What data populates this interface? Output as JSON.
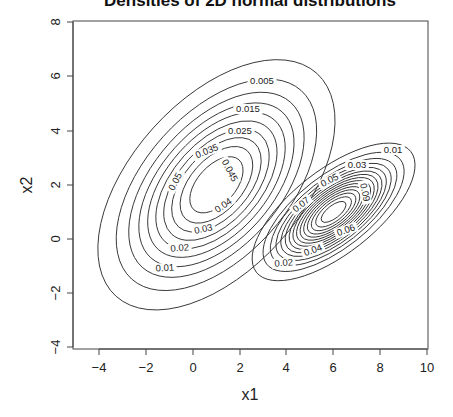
{
  "chart_data": {
    "type": "contour",
    "title": "Densities of 2D normal distributions",
    "xlabel": "x1",
    "ylabel": "x2",
    "xlim": [
      -5,
      10
    ],
    "ylim": [
      -4,
      8
    ],
    "x_ticks": [
      -4,
      -2,
      0,
      2,
      4,
      6,
      8,
      10
    ],
    "y_ticks": [
      -4,
      -2,
      0,
      2,
      4,
      6,
      8
    ],
    "grid": false,
    "series": [
      {
        "name": "distribution 1",
        "center": [
          1,
          2
        ],
        "levels": [
          0.005,
          0.01,
          0.015,
          0.02,
          0.025,
          0.03,
          0.035,
          0.04,
          0.045,
          0.05
        ],
        "labeled_levels": [
          "0.005",
          "0.015",
          "0.025",
          "0.035",
          "0.045",
          "0.05",
          "0.04",
          "0.03",
          "0.02",
          "0.01"
        ]
      },
      {
        "name": "distribution 2",
        "center": [
          6,
          1
        ],
        "levels": [
          0.01,
          0.02,
          0.03,
          0.04,
          0.05,
          0.06,
          0.07,
          0.08,
          0.09,
          0.1,
          0.11,
          0.12,
          0.13,
          0.14,
          0.15
        ],
        "labeled_levels": [
          "0.01",
          "0.03",
          "0.05",
          "0.07",
          "0.09",
          "0.06",
          "0.04",
          "0.02"
        ]
      }
    ]
  },
  "labels": {
    "title": "Densities of 2D normal distributions",
    "xlabel": "x1",
    "ylabel": "x2",
    "x_ticks": [
      "−4",
      "−2",
      "0",
      "2",
      "4",
      "6",
      "8",
      "10"
    ],
    "y_ticks": [
      "−4",
      "−2",
      "0",
      "2",
      "4",
      "6",
      "8"
    ]
  },
  "contour_labels": {
    "d1": [
      "0.005",
      "0.015",
      "0.025",
      "0.035",
      "0.045",
      "0.05",
      "0.04",
      "0.03",
      "0.02",
      "0.01"
    ],
    "d2": [
      "0.01",
      "0.03",
      "0.05",
      "0.07",
      "0.09",
      "0.06",
      "0.04",
      "0.02"
    ]
  }
}
